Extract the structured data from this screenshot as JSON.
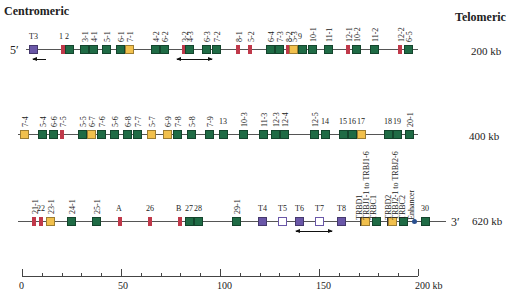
{
  "headers": {
    "left": "Centromeric",
    "right": "Telomeric"
  },
  "colors": {
    "functional_V": "#1f6b45",
    "pseudogene": "#c0394a",
    "orf": "#f1c04d",
    "trypsinogen": "#6a57a8",
    "trypsinogen_pseudo": "#ffffff",
    "enhancer": "#2a4f8f",
    "line": "#555555"
  },
  "rows": [
    {
      "start_label": "5′",
      "kb_label": "200 kb",
      "genes": [
        {
          "label": "T3",
          "type": "trypsinogen",
          "x": 33
        },
        {
          "label": "1",
          "type": "pseudogene",
          "x": 63
        },
        {
          "label": "2",
          "type": "functional_V",
          "x": 69
        },
        {
          "label": "3-1",
          "type": "functional_V",
          "x": 84
        },
        {
          "label": "4-1",
          "type": "functional_V",
          "x": 93
        },
        {
          "label": "5-1",
          "type": "functional_V",
          "x": 106
        },
        {
          "label": "6-1",
          "type": "functional_V",
          "x": 120
        },
        {
          "label": "7-1",
          "type": "orf",
          "x": 129
        },
        {
          "label": "4-2",
          "type": "functional_V",
          "x": 155
        },
        {
          "label": "6-2",
          "type": "functional_V",
          "x": 164
        },
        {
          "label": "3-2",
          "type": "pseudogene",
          "x": 184
        },
        {
          "label": "4-3",
          "type": "functional_V",
          "x": 189
        },
        {
          "label": "6-3",
          "type": "functional_V",
          "x": 206
        },
        {
          "label": "7-2",
          "type": "functional_V",
          "x": 216
        },
        {
          "label": "8-1",
          "type": "pseudogene",
          "x": 238
        },
        {
          "label": "5-2",
          "type": "pseudogene",
          "x": 250
        },
        {
          "label": "6-4",
          "type": "functional_V",
          "x": 270
        },
        {
          "label": "7-3",
          "type": "functional_V",
          "x": 279
        },
        {
          "label": "8-2",
          "type": "pseudogene",
          "x": 288
        },
        {
          "label": "5-3",
          "type": "orf",
          "x": 293
        },
        {
          "label": "9",
          "type": "functional_V",
          "x": 302
        },
        {
          "label": "10-1",
          "type": "functional_V",
          "x": 312
        },
        {
          "label": "11-1",
          "type": "functional_V",
          "x": 328
        },
        {
          "label": "12-1",
          "type": "pseudogene",
          "x": 348
        },
        {
          "label": "10-2",
          "type": "functional_V",
          "x": 356
        },
        {
          "label": "11-2",
          "type": "functional_V",
          "x": 374
        },
        {
          "label": "12-2",
          "type": "pseudogene",
          "x": 400
        },
        {
          "label": "6-5",
          "type": "functional_V",
          "x": 408
        }
      ],
      "arrows": [
        {
          "x1": 33,
          "x2": 46,
          "dir": "left"
        },
        {
          "x1": 177,
          "x2": 212,
          "dir": "both"
        }
      ]
    },
    {
      "start_label": "",
      "kb_label": "400 kb",
      "genes": [
        {
          "label": "7-4",
          "type": "orf",
          "x": 24
        },
        {
          "label": "5-4",
          "type": "functional_V",
          "x": 42
        },
        {
          "label": "6-6",
          "type": "functional_V",
          "x": 53
        },
        {
          "label": "7-5",
          "type": "pseudogene",
          "x": 62
        },
        {
          "label": "5-5",
          "type": "functional_V",
          "x": 82
        },
        {
          "label": "6-7",
          "type": "orf",
          "x": 91
        },
        {
          "label": "7-6",
          "type": "functional_V",
          "x": 101
        },
        {
          "label": "5-6",
          "type": "functional_V",
          "x": 114
        },
        {
          "label": "6-8",
          "type": "functional_V",
          "x": 127
        },
        {
          "label": "7-7",
          "type": "functional_V",
          "x": 137
        },
        {
          "label": "5-7",
          "type": "orf",
          "x": 151
        },
        {
          "label": "6-9",
          "type": "orf",
          "x": 167
        },
        {
          "label": "7-8",
          "type": "functional_V",
          "x": 177
        },
        {
          "label": "5-8",
          "type": "functional_V",
          "x": 191
        },
        {
          "label": "7-9",
          "type": "functional_V",
          "x": 209
        },
        {
          "label": "13",
          "type": "functional_V",
          "x": 223
        },
        {
          "label": "10-3",
          "type": "functional_V",
          "x": 243
        },
        {
          "label": "11-3",
          "type": "functional_V",
          "x": 263
        },
        {
          "label": "12-3",
          "type": "functional_V",
          "x": 275
        },
        {
          "label": "12-4",
          "type": "functional_V",
          "x": 284
        },
        {
          "label": "12-5",
          "type": "functional_V",
          "x": 314
        },
        {
          "label": "14",
          "type": "functional_V",
          "x": 325
        },
        {
          "label": "15",
          "type": "functional_V",
          "x": 343
        },
        {
          "label": "16",
          "type": "functional_V",
          "x": 352
        },
        {
          "label": "17",
          "type": "orf",
          "x": 361
        },
        {
          "label": "18",
          "type": "functional_V",
          "x": 388
        },
        {
          "label": "19",
          "type": "functional_V",
          "x": 397
        },
        {
          "label": "20-1",
          "type": "functional_V",
          "x": 409
        }
      ],
      "arrows": []
    },
    {
      "start_label": "",
      "end_label": "3′",
      "kb_label": "620 kb",
      "genes": [
        {
          "label": "21-1",
          "type": "pseudogene",
          "x": 34
        },
        {
          "label": "22",
          "type": "pseudogene",
          "x": 41
        },
        {
          "label": "23-1",
          "type": "orf",
          "x": 50
        },
        {
          "label": "24-1",
          "type": "functional_V",
          "x": 71
        },
        {
          "label": "25-1",
          "type": "functional_V",
          "x": 96
        },
        {
          "label": "A",
          "type": "pseudogene",
          "x": 120
        },
        {
          "label": "26",
          "type": "pseudogene",
          "x": 150
        },
        {
          "label": "B",
          "type": "pseudogene",
          "x": 180
        },
        {
          "label": "27",
          "type": "functional_V",
          "x": 189
        },
        {
          "label": "28",
          "type": "functional_V",
          "x": 198
        },
        {
          "label": "29-1",
          "type": "functional_V",
          "x": 236
        },
        {
          "label": "T4",
          "type": "trypsinogen",
          "x": 262
        },
        {
          "label": "T5",
          "type": "trypsinogen_pseudo",
          "x": 282
        },
        {
          "label": "T6",
          "type": "trypsinogen",
          "x": 299
        },
        {
          "label": "T7",
          "type": "trypsinogen_pseudo",
          "x": 319
        },
        {
          "label": "T8",
          "type": "trypsinogen",
          "x": 341
        },
        {
          "label": "TRBD1 / TRBJ1-1 to TRBJ1-6",
          "type": "orf",
          "x": 365
        },
        {
          "label": "TRBC1",
          "type": "functional_V",
          "x": 376
        },
        {
          "label": "TRBD2 / TRBJ2-1 to TRBJ2-6",
          "type": "orf",
          "x": 392
        },
        {
          "label": "TRBC2",
          "type": "functional_V",
          "x": 403
        },
        {
          "label": "Enhancer",
          "type": "enhancer",
          "x": 414
        },
        {
          "label": "30",
          "type": "functional_V",
          "x": 425
        }
      ],
      "vertical_labels": [
        "TRBD1",
        "TRBJ1-1 to TRBJ1-6",
        "TRBC1",
        "TRBD2",
        "TRBJ2-1 to TRBJ2-6",
        "TRBC2",
        "Enhancer"
      ],
      "arrows": [
        {
          "x1": 296,
          "x2": 332,
          "dir": "both"
        }
      ]
    }
  ],
  "scale": {
    "ticks": [
      "0",
      "50",
      "100",
      "150",
      "200 kb"
    ],
    "unit": "kb",
    "max": 200,
    "minor_step": 10
  }
}
